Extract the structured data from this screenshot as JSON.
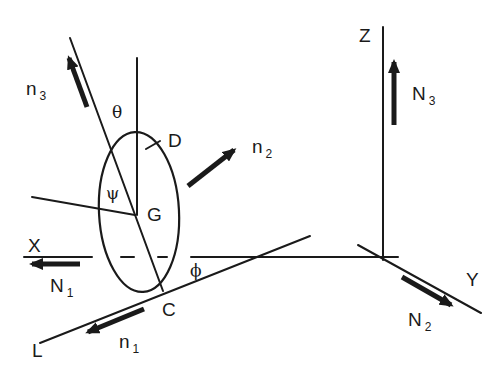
{
  "figure": {
    "type": "rigid-body-kinematics-diagram",
    "colors": {
      "ink": "#1a1a1a",
      "background": "#ffffff"
    }
  },
  "labels": {
    "n3": {
      "base": "n",
      "sub": "3"
    },
    "n2": {
      "base": "n",
      "sub": "2"
    },
    "n1": {
      "base": "n",
      "sub": "1"
    },
    "N1": {
      "base": "N",
      "sub": "1"
    },
    "N2": {
      "base": "N",
      "sub": "2"
    },
    "N3": {
      "base": "N",
      "sub": "3"
    },
    "theta": "θ",
    "psi": "ψ",
    "phi": "ϕ",
    "D": "D",
    "G": "G",
    "C": "C",
    "L": "L",
    "X": "X",
    "Y": "Y",
    "Z": "Z"
  },
  "axes": {
    "inertial": [
      "X",
      "Y",
      "Z"
    ],
    "body": [
      "n1",
      "n2",
      "n3"
    ],
    "inertial_unit_vectors": [
      "N1",
      "N2",
      "N3"
    ]
  },
  "points": [
    "G",
    "C",
    "D",
    "L"
  ],
  "angles": [
    "theta",
    "psi",
    "phi"
  ]
}
